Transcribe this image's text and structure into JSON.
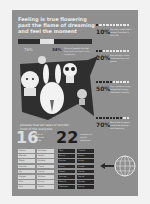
{
  "infographic": {
    "title": "Feeling is true flowering past the flame of dreaming and feel the moment",
    "progress": {
      "left_pct": "76%",
      "mid_pct": "34%",
      "note": "Share of people who feel they have lost touch with simple joys"
    },
    "stats": [
      {
        "value": "10%",
        "filled": 1,
        "total": 10,
        "desc": "Say they rarely feel a sense of wonder in daily life"
      },
      {
        "value": "20%",
        "filled": 2,
        "total": 10,
        "desc": "Are nostalgic about childhood toys and games"
      },
      {
        "value": "50%",
        "filled": 5,
        "total": 10,
        "desc": "Say a cartoon or toy brings back happy memories instantly"
      },
      {
        "value": "70%",
        "filled": 8,
        "total": 10,
        "desc": "Would like to spend more time playing and dreaming"
      }
    ],
    "tagline": "phrases that tell tales of wonder most of the everyone",
    "left_list": {
      "count": "16",
      "note": "words of childhood wonder",
      "items": [
        "Dream",
        "Rainbow",
        "Wonder",
        "Bright",
        "Magic",
        "Bubble",
        "Sparkle",
        "Cloud",
        "Joy",
        "Candy",
        "Giggle",
        "Balloon",
        "Kite",
        "Sunny",
        "Star",
        "Smile"
      ]
    },
    "right_list": {
      "count": "22",
      "note": "moments of playful adventure",
      "items": [
        "Toys",
        "Friends",
        "Bunny",
        "Panda",
        "Dance",
        "Laugh",
        "Picnic",
        "Puzzle",
        "Forest",
        "Castle",
        "Journey",
        "Secret",
        "Moonlit",
        "Garden",
        "Treasure",
        "Swing"
      ]
    },
    "icons": {
      "arrow": "arrow-left-icon",
      "globe": "globe-icon"
    }
  }
}
